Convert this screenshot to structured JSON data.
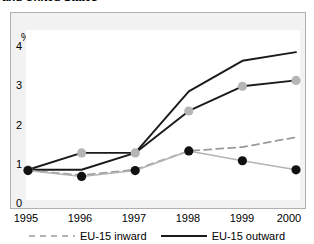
{
  "title": "and United States",
  "axis": {
    "y_unit_label": "%",
    "y_ticks": [
      "4",
      "3",
      "2",
      "1",
      "0"
    ],
    "x_ticks": [
      "1995",
      "1996",
      "1997",
      "1998",
      "1999",
      "2000"
    ]
  },
  "legend": {
    "items": [
      {
        "label": "EU-15 inward",
        "style": "dashed",
        "color": "#9a9a9a"
      },
      {
        "label": "EU-15 outward",
        "style": "solid",
        "color": "#1a1a1a"
      }
    ]
  },
  "colors": {
    "solid_line": "#1a1a1a",
    "dashed_line": "#9a9a9a",
    "light_line": "#b4b4b4",
    "gray_marker": "#b5b5b5",
    "black_marker": "#111111",
    "panel_bg": "#f2f2f2",
    "plot_bg": "#ffffff",
    "frame_border": "#b0b0b0"
  },
  "chart_data": {
    "type": "line",
    "title": "and United States",
    "xlabel": "",
    "ylabel": "%",
    "x": [
      "1995",
      "1996",
      "1997",
      "1998",
      "1999",
      "2000"
    ],
    "ylim": [
      0,
      4.3
    ],
    "xlim": [
      1995,
      2000
    ],
    "yticks": [
      0,
      1,
      2,
      3,
      4
    ],
    "grid": false,
    "legend_position": "bottom",
    "series": [
      {
        "name": "US outward",
        "style": "solid",
        "color": "#1a1a1a",
        "marker": "none",
        "values": [
          0.72,
          0.72,
          1.15,
          2.72,
          3.5,
          3.72
        ]
      },
      {
        "name": "EU-15 outward",
        "style": "solid",
        "color": "#1a1a1a",
        "marker": "circle-gray",
        "values": [
          0.72,
          1.15,
          1.15,
          2.22,
          2.85,
          3.0
        ]
      },
      {
        "name": "EU-15 inward",
        "style": "dashed",
        "color": "#9a9a9a",
        "marker": "none",
        "values": [
          0.7,
          0.58,
          0.72,
          1.2,
          1.3,
          1.55
        ]
      },
      {
        "name": "US inward",
        "style": "solid-light",
        "color": "#b4b4b4",
        "marker": "circle-black",
        "values": [
          0.7,
          0.55,
          0.7,
          1.2,
          0.95,
          0.72
        ]
      }
    ]
  }
}
